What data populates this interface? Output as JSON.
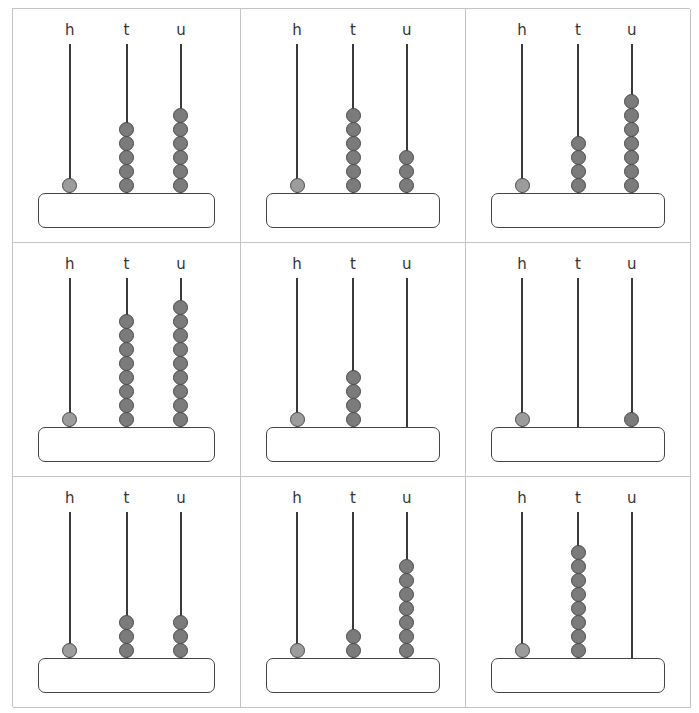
{
  "worksheet": {
    "rod_labels": [
      "h",
      "t",
      "u"
    ],
    "colors": {
      "hundreds_bead": "#9c9c9c",
      "tens_units_bead": "#7b7b7b",
      "rod": "#3a3a3a",
      "grid_line": "#c4c4c4"
    },
    "abacuses": [
      {
        "h": 1,
        "t": 5,
        "u": 6,
        "answer": ""
      },
      {
        "h": 1,
        "t": 6,
        "u": 3,
        "answer": ""
      },
      {
        "h": 1,
        "t": 4,
        "u": 7,
        "answer": ""
      },
      {
        "h": 1,
        "t": 8,
        "u": 9,
        "answer": ""
      },
      {
        "h": 1,
        "t": 4,
        "u": 0,
        "answer": ""
      },
      {
        "h": 1,
        "t": 0,
        "u": 1,
        "answer": ""
      },
      {
        "h": 1,
        "t": 3,
        "u": 3,
        "answer": ""
      },
      {
        "h": 1,
        "t": 2,
        "u": 7,
        "answer": ""
      },
      {
        "h": 1,
        "t": 8,
        "u": 0,
        "answer": ""
      }
    ]
  }
}
